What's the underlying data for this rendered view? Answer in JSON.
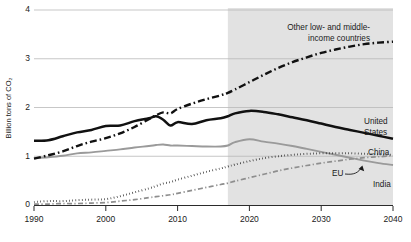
{
  "chart_data": {
    "type": "line",
    "title": "",
    "subtitle": "",
    "xlabel": "",
    "ylabel": "Billion tons of CO₂",
    "xlim": [
      1990,
      2040
    ],
    "ylim": [
      0,
      4
    ],
    "grid": "horizontal",
    "legend_position": "inline-right",
    "x_ticks": [
      "1990",
      "2000",
      "2010",
      "2020",
      "2030",
      "2040"
    ],
    "x_tick_values": [
      1990,
      2000,
      2010,
      2020,
      2030,
      2040
    ],
    "y_ticks": [
      "0",
      "1",
      "2",
      "3",
      "4"
    ],
    "y_tick_values": [
      0,
      1,
      2,
      3,
      4
    ],
    "projection_start_year": 2017,
    "projection_shading_color": "#e2e2e2",
    "annotations": [
      {
        "name": "eu-callout-arrow",
        "label": "EU",
        "points_to_series": "EU"
      }
    ],
    "x": [
      1990,
      1992,
      1994,
      1996,
      1998,
      2000,
      2002,
      2004,
      2006,
      2007,
      2008,
      2009,
      2010,
      2012,
      2014,
      2016,
      2017,
      2018,
      2020,
      2022,
      2024,
      2026,
      2028,
      2030,
      2032,
      2034,
      2036,
      2038,
      2040
    ],
    "series": [
      {
        "name": "Other low- and middle-income countries",
        "label": "Other low- and middle-\nincome countries",
        "label_line1": "Other low- and middle-",
        "label_line2": "income countries",
        "style": "dash-dot",
        "color": "#111111",
        "width": "thick",
        "values": [
          0.95,
          1.02,
          1.1,
          1.21,
          1.3,
          1.37,
          1.47,
          1.6,
          1.76,
          1.84,
          1.9,
          1.88,
          1.97,
          2.08,
          2.17,
          2.25,
          2.3,
          2.37,
          2.52,
          2.67,
          2.81,
          2.93,
          3.03,
          3.12,
          3.19,
          3.25,
          3.3,
          3.33,
          3.35
        ]
      },
      {
        "name": "United States",
        "label": "United States",
        "label_line1": "United",
        "label_line2": "States",
        "style": "solid",
        "color": "#111111",
        "width": "thick",
        "values": [
          1.32,
          1.33,
          1.41,
          1.49,
          1.54,
          1.62,
          1.63,
          1.72,
          1.78,
          1.82,
          1.75,
          1.63,
          1.7,
          1.66,
          1.74,
          1.78,
          1.82,
          1.88,
          1.93,
          1.91,
          1.86,
          1.8,
          1.74,
          1.67,
          1.6,
          1.54,
          1.48,
          1.42,
          1.36
        ]
      },
      {
        "name": "China",
        "label": "China",
        "style": "solid",
        "color": "#9a9a9a",
        "width": "medium",
        "values": [
          0.96,
          0.98,
          1.01,
          1.06,
          1.08,
          1.11,
          1.14,
          1.18,
          1.21,
          1.23,
          1.24,
          1.22,
          1.22,
          1.21,
          1.2,
          1.2,
          1.22,
          1.29,
          1.35,
          1.3,
          1.26,
          1.21,
          1.15,
          1.09,
          1.03,
          0.97,
          0.91,
          0.86,
          0.82
        ]
      },
      {
        "name": "EU",
        "label": "EU",
        "style": "dotted",
        "color": "#111111",
        "width": "medium",
        "values": [
          0.06,
          0.08,
          0.08,
          0.1,
          0.11,
          0.12,
          0.18,
          0.26,
          0.34,
          0.39,
          0.44,
          0.47,
          0.52,
          0.6,
          0.68,
          0.75,
          0.79,
          0.83,
          0.9,
          0.96,
          1.0,
          1.03,
          1.05,
          1.06,
          1.06,
          1.06,
          1.05,
          1.04,
          1.03
        ]
      },
      {
        "name": "India",
        "label": "India",
        "style": "dash-dot-thin",
        "color": "#8e8e8e",
        "width": "thin",
        "values": [
          0.02,
          0.02,
          0.03,
          0.03,
          0.04,
          0.05,
          0.08,
          0.11,
          0.15,
          0.17,
          0.19,
          0.21,
          0.24,
          0.3,
          0.36,
          0.42,
          0.45,
          0.49,
          0.56,
          0.63,
          0.7,
          0.76,
          0.81,
          0.86,
          0.9,
          0.94,
          0.97,
          0.99,
          1.01
        ]
      }
    ]
  },
  "axis": {
    "y_title": "Billion tons of CO₂"
  },
  "labels": {
    "other_line1": "Other low- and middle-",
    "other_line2": "income countries",
    "us_line1": "United",
    "us_line2": "States",
    "china": "China",
    "eu": "EU",
    "india": "India"
  },
  "ticks": {
    "y": [
      "0",
      "1",
      "2",
      "3",
      "4"
    ],
    "x": [
      "1990",
      "2000",
      "2010",
      "2020",
      "2030",
      "2040"
    ]
  },
  "footer": {
    "source_note": ""
  }
}
